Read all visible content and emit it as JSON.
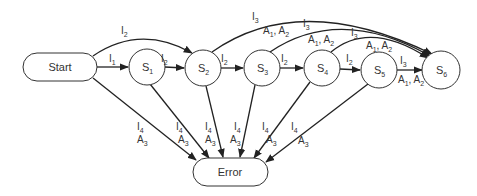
{
  "diagram": {
    "type": "state-transition",
    "nodes": [
      {
        "id": "start",
        "label": "Start",
        "shape": "pill"
      },
      {
        "id": "s1",
        "label": "S",
        "sub": "1",
        "shape": "circle"
      },
      {
        "id": "s2",
        "label": "S",
        "sub": "2",
        "shape": "circle"
      },
      {
        "id": "s3",
        "label": "S",
        "sub": "3",
        "shape": "circle"
      },
      {
        "id": "s4",
        "label": "S",
        "sub": "4",
        "shape": "circle"
      },
      {
        "id": "s5",
        "label": "S",
        "sub": "5",
        "shape": "circle"
      },
      {
        "id": "s6",
        "label": "S",
        "sub": "6",
        "shape": "circle"
      },
      {
        "id": "error",
        "label": "Error",
        "shape": "pill"
      }
    ],
    "edges": [
      {
        "from": "start",
        "to": "s1",
        "label": "I1"
      },
      {
        "from": "start",
        "to": "s2",
        "label": "I2"
      },
      {
        "from": "s1",
        "to": "s2",
        "label": "I2"
      },
      {
        "from": "s2",
        "to": "s3",
        "label": "I2"
      },
      {
        "from": "s3",
        "to": "s4",
        "label": "I2"
      },
      {
        "from": "s4",
        "to": "s5",
        "label": "I2"
      },
      {
        "from": "s2",
        "to": "s6",
        "label": "I3 / A1, A2"
      },
      {
        "from": "s3",
        "to": "s6",
        "label": "I3 / A1, A2"
      },
      {
        "from": "s4",
        "to": "s6",
        "label": "I3 / A1, A2"
      },
      {
        "from": "s5",
        "to": "s6",
        "label": "I3 / A1, A2"
      },
      {
        "from": "start",
        "to": "error",
        "label": "I4 / A3"
      },
      {
        "from": "s1",
        "to": "error",
        "label": "I4 / A3"
      },
      {
        "from": "s2",
        "to": "error",
        "label": "I4 / A3"
      },
      {
        "from": "s3",
        "to": "error",
        "label": "I4 / A3"
      },
      {
        "from": "s4",
        "to": "error",
        "label": "I4 / A3"
      },
      {
        "from": "s5",
        "to": "error",
        "label": "I4 / A3"
      }
    ]
  },
  "labels": {
    "start": "Start",
    "error": "Error",
    "S": "S",
    "I": "I",
    "A": "A",
    "sep": ", ",
    "n1": "1",
    "n2": "2",
    "n3": "3",
    "n4": "4",
    "n5": "5",
    "n6": "6"
  }
}
